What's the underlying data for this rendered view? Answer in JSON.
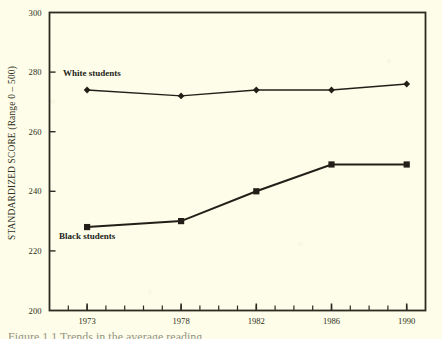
{
  "chart_data": {
    "type": "line",
    "title": "",
    "xlabel": "",
    "ylabel": "STANDARDIZED SCORE (Range 0 – 500)",
    "x": [
      1973,
      1978,
      1982,
      1986,
      1990
    ],
    "xtick_labels": [
      "1973",
      "1978",
      "1982",
      "1986",
      "1990"
    ],
    "ytick_labels": [
      "200",
      "220",
      "240",
      "260",
      "280",
      "300"
    ],
    "ytick_values": [
      200,
      220,
      240,
      260,
      280,
      300
    ],
    "ylim": [
      200,
      300
    ],
    "xlim": [
      1971,
      1991
    ],
    "grid": false,
    "legend_position": "inline-annotations",
    "series": [
      {
        "name": "White students",
        "label": "White students",
        "marker": "diamond",
        "color": "#231f18",
        "values": [
          274,
          272,
          274,
          274,
          276
        ]
      },
      {
        "name": "Black students",
        "label": "Black students",
        "marker": "square",
        "color": "#231f18",
        "values": [
          228,
          230,
          240,
          249,
          249
        ]
      }
    ],
    "annotations": [
      {
        "text": "White students",
        "x": 1973,
        "y": 279
      },
      {
        "text": "Black students",
        "x": 1973,
        "y": 224
      }
    ],
    "minor_xticks": [
      1972,
      1973,
      1974,
      1975,
      1976,
      1977,
      1978,
      1979,
      1980,
      1981,
      1982,
      1983,
      1984,
      1985,
      1986,
      1987,
      1988,
      1989,
      1990
    ]
  },
  "figure": {
    "background_color": "#fdfde9",
    "ink_color": "#2b2b22",
    "caption": "Figure 1.1  Trends in the average reading"
  }
}
